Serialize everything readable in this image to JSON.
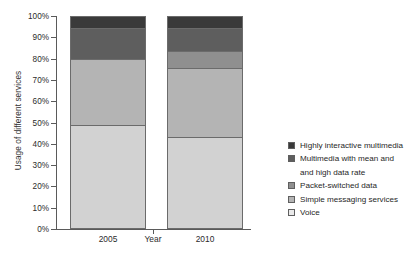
{
  "chart_data": {
    "type": "bar",
    "subtype": "stacked-percentage-column",
    "title": "",
    "xlabel": "Year",
    "ylabel": "Usage of different services",
    "categories": [
      "2005",
      "2010"
    ],
    "ylim": [
      0,
      100
    ],
    "yticks": [
      "0%",
      "10%",
      "20%",
      "30%",
      "40%",
      "50%",
      "60%",
      "70%",
      "80%",
      "90%",
      "100%"
    ],
    "ytick_values": [
      0,
      10,
      20,
      30,
      40,
      50,
      60,
      70,
      80,
      90,
      100
    ],
    "grid": false,
    "legend_position": "right",
    "stack_order_bottom_to_top": [
      "Voice",
      "Simple messaging services",
      "Packet-switched data",
      "Multimedia with mean and and high data rate",
      "Highly interactive multimedia"
    ],
    "series": [
      {
        "name": "Highly interactive multimedia",
        "color": "#3a3a3a",
        "values": [
          5,
          5
        ],
        "cumulative_top": [
          100,
          100
        ]
      },
      {
        "name": "Multimedia with mean and and high data rate",
        "color": "#5e5e5e",
        "values": [
          15,
          11
        ],
        "cumulative_top": [
          95,
          95
        ]
      },
      {
        "name": "Packet-switched data",
        "color": "#8f8f8f",
        "values": [
          0,
          8
        ],
        "cumulative_top": [
          80,
          84
        ]
      },
      {
        "name": "Simple messaging services",
        "color": "#b4b4b4",
        "values": [
          31,
          33
        ],
        "cumulative_top": [
          80,
          76
        ]
      },
      {
        "name": "Voice",
        "color": "#d2d2d2",
        "values": [
          49,
          43
        ],
        "cumulative_top": [
          49,
          43
        ]
      }
    ]
  },
  "axis": {
    "y_title": "Usage of different services",
    "x_title": "Year",
    "ticks": [
      {
        "label": "100%",
        "value": 100
      },
      {
        "label": "90%",
        "value": 90
      },
      {
        "label": "80%",
        "value": 80
      },
      {
        "label": "70%",
        "value": 70
      },
      {
        "label": "60%",
        "value": 60
      },
      {
        "label": "50%",
        "value": 50
      },
      {
        "label": "40%",
        "value": 40
      },
      {
        "label": "30%",
        "value": 30
      },
      {
        "label": "20%",
        "value": 20
      },
      {
        "label": "10%",
        "value": 10
      },
      {
        "label": "0%",
        "value": 0
      }
    ],
    "category_labels": [
      "2005",
      "2010"
    ]
  },
  "legend": {
    "items": [
      {
        "label": "Highly interactive multimedia",
        "color": "#3a3a3a"
      },
      {
        "label": "Multimedia with mean and",
        "color": "#5e5e5e"
      },
      {
        "label": "and high data rate",
        "color": "",
        "continuation": true
      },
      {
        "label": "Packet-switched data",
        "color": "#8f8f8f"
      },
      {
        "label": "Simple messaging services",
        "color": "#b4b4b4"
      },
      {
        "label": "Voice",
        "color": "#eaeaea"
      }
    ]
  }
}
